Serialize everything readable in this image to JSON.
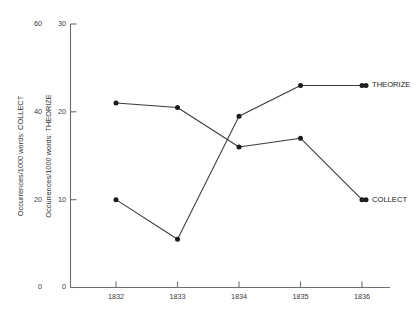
{
  "chart_data": {
    "type": "line",
    "title": "",
    "xlabel": "",
    "x": [
      1832,
      1833,
      1834,
      1835,
      1836
    ],
    "xticklabels": [
      "1832",
      "1833",
      "1834",
      "1835",
      "1836"
    ],
    "grid": false,
    "legend_position": "right-inline-labels",
    "axes": [
      {
        "id": "outer",
        "name": "collect-axis",
        "ylabel": "Occurrences/1000 words: COLLECT",
        "ylim": [
          0,
          60
        ],
        "yticks": [
          0,
          20,
          40,
          60
        ],
        "yticklabels": [
          "0",
          "20",
          "40",
          "60"
        ]
      },
      {
        "id": "inner",
        "name": "theorize-axis",
        "ylabel": "Occurrences/1000 words: THEORIZE",
        "ylim": [
          0,
          30
        ],
        "yticks": [
          0,
          10,
          20,
          30
        ],
        "yticklabels": [
          "0",
          "10",
          "20",
          "30"
        ]
      }
    ],
    "series": [
      {
        "name": "COLLECT",
        "label": "COLLECT",
        "axis": "outer",
        "marker": "filled-circle",
        "color": "#1c1c1c",
        "values": [
          42.0,
          41.0,
          32.0,
          34.0,
          20.0
        ],
        "values_on_inner_scale": [
          21.0,
          20.5,
          16.0,
          17.0,
          10.0
        ]
      },
      {
        "name": "THEORIZE",
        "label": "THEORIZE",
        "axis": "inner",
        "marker": "filled-circle",
        "color": "#1c1c1c",
        "values": [
          10.0,
          5.5,
          19.5,
          23.0,
          23.0
        ]
      }
    ]
  }
}
